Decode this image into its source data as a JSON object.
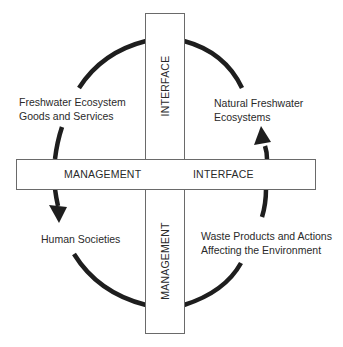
{
  "diagram": {
    "type": "cycle-with-interface-cross",
    "bars": {
      "horizontal": {
        "left_label": "MANAGEMENT",
        "right_label": "INTERFACE"
      },
      "vertical": {
        "top_label": "INTERFACE",
        "bottom_label": "MANAGEMENT"
      }
    },
    "nodes": [
      {
        "id": "freshwater-goods",
        "line1": "Freshwater Ecosystem",
        "line2": "Goods and Services",
        "position": "top-left"
      },
      {
        "id": "natural-ecosystems",
        "line1": "Natural Freshwater",
        "line2": "Ecosystems",
        "position": "top-right"
      },
      {
        "id": "human-societies",
        "line1": "Human Societies",
        "line2": "",
        "position": "bottom-left"
      },
      {
        "id": "waste-products",
        "line1": "Waste Products and Actions",
        "line2": "Affecting the Environment",
        "position": "bottom-right"
      }
    ],
    "flow": "clockwise: Natural Freshwater Ecosystems -> Freshwater Ecosystem Goods and Services -> Human Societies -> Waste Products and Actions Affecting the Environment -> Natural Freshwater Ecosystems",
    "colors": {
      "arc": "#1e1e1e",
      "border": "#6a6a6a",
      "text": "#2a2a2a",
      "background": "#ffffff"
    }
  }
}
